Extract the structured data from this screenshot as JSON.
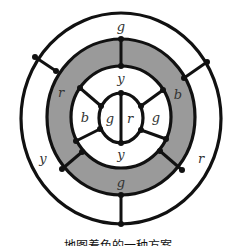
{
  "diagram": {
    "type": "concentric-ring-map-coloring",
    "colors": {
      "gray_fill": "#9a9a9a",
      "white_fill": "#ffffff",
      "stroke": "#111111",
      "label": "#333333"
    },
    "regions": {
      "outer_ring": {
        "top": "g",
        "left": "y",
        "right": "r"
      },
      "gray_ring": {
        "left": "r",
        "right": "b",
        "bottom": "g"
      },
      "inner_ring": {
        "top": "y",
        "left": "b",
        "right": "g",
        "bottom": "y"
      },
      "center": {
        "left": "g",
        "right": "r"
      }
    }
  },
  "caption": "地图着色的一种方案"
}
